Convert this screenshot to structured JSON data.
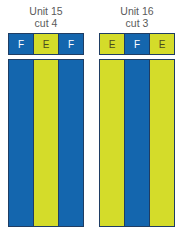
{
  "units": [
    {
      "title_line1": "Unit 15",
      "title_line2": "cut 4",
      "top_cells": [
        {
          "label": "F",
          "color": "blue"
        },
        {
          "label": "E",
          "color": "yellow"
        },
        {
          "label": "F",
          "color": "blue"
        }
      ],
      "strips": [
        "blue",
        "yellow",
        "blue"
      ]
    },
    {
      "title_line1": "Unit 16",
      "title_line2": "cut 3",
      "top_cells": [
        {
          "label": "E",
          "color": "yellow"
        },
        {
          "label": "F",
          "color": "blue"
        },
        {
          "label": "E",
          "color": "yellow"
        }
      ],
      "strips": [
        "yellow",
        "blue",
        "yellow"
      ]
    }
  ],
  "colors": {
    "blue": "#1466ae",
    "yellow": "#d4dc2a",
    "border": "#1f3d63"
  }
}
